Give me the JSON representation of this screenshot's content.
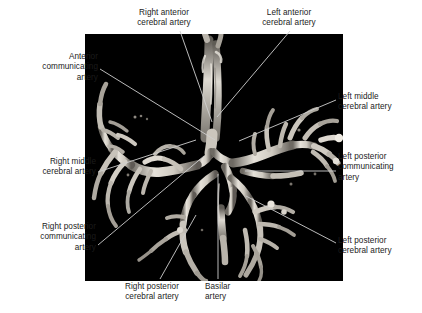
{
  "figure": {
    "kind": "3D angiogram of the Circle of Willis",
    "panel": {
      "background_color": "#000000",
      "vessel_color": "#d8d4cc",
      "left": 85,
      "top": 34,
      "width": 258,
      "height": 247
    },
    "page_background": "#ffffff",
    "label_color": "#1b1b1b",
    "leader_color": "#c9c9c9"
  },
  "labels": [
    {
      "id": "right-anterior-cerebral-artery",
      "text": "Right anterior\ncerebral artery",
      "align": "center",
      "leader": {
        "x1": 180,
        "y1": 31,
        "x2": 212,
        "y2": 122
      }
    },
    {
      "id": "left-anterior-cerebral-artery",
      "text": "Left anterior\ncerebral artery",
      "align": "center",
      "leader": {
        "x1": 290,
        "y1": 31,
        "x2": 217,
        "y2": 117
      }
    },
    {
      "id": "anterior-communicating-artery",
      "text": "Anterior\ncommunicating\nartery",
      "align": "right",
      "leader": {
        "x1": 100,
        "y1": 69,
        "x2": 215,
        "y2": 140
      }
    },
    {
      "id": "left-middle-cerebral-artery",
      "text": "Left middle\ncerebral artery",
      "align": "left",
      "leader": {
        "x1": 336,
        "y1": 100,
        "x2": 239,
        "y2": 141
      }
    },
    {
      "id": "right-middle-cerebral-artery",
      "text": "Right middle\ncerebral artery",
      "align": "right",
      "leader": {
        "x1": 98,
        "y1": 172,
        "x2": 196,
        "y2": 140
      }
    },
    {
      "id": "left-posterior-communicating-artery",
      "text": "Left posterior\ncommunicating\nartery",
      "align": "left",
      "leader": {
        "x1": 336,
        "y1": 171,
        "x2": 245,
        "y2": 171
      }
    },
    {
      "id": "right-posterior-communicating-artery",
      "text": "Right posterior\ncommunicating\nartery",
      "align": "right",
      "leader": {
        "x1": 98,
        "y1": 245,
        "x2": 204,
        "y2": 156
      }
    },
    {
      "id": "left-posterior-cerebral-artery",
      "text": "Left posterior\ncerebral artery",
      "align": "left",
      "leader": {
        "x1": 336,
        "y1": 243,
        "x2": 246,
        "y2": 196
      }
    },
    {
      "id": "right-posterior-cerebral-artery",
      "text": "Right posterior\ncerebral artery",
      "align": "center",
      "leader": {
        "x1": 160,
        "y1": 279,
        "x2": 196,
        "y2": 215
      }
    },
    {
      "id": "basilar-artery",
      "text": "Basilar\nartery",
      "align": "left",
      "leader": {
        "x1": 218,
        "y1": 279,
        "x2": 218,
        "y2": 174
      }
    }
  ]
}
